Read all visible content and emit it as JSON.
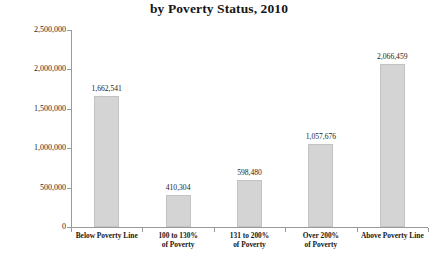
{
  "chart_data": {
    "type": "bar",
    "title": "by Poverty Status, 2010",
    "xlabel": "",
    "ylabel": "Recipients",
    "ylim": [
      0,
      2500000
    ],
    "grid": false,
    "legend": null,
    "ytick_labels": [
      "0",
      "500,000",
      "1,000,000",
      "1,500,000",
      "2,000,000",
      "2,500,000"
    ],
    "ytick_values": [
      0,
      500000,
      1000000,
      1500000,
      2000000,
      2500000
    ],
    "categories": [
      "Below Poverty Line",
      "100 to 130%\nof Poverty",
      "131 to 200%\nof Poverty",
      "Over 200%\nof Poverty",
      "Above Poverty Line"
    ],
    "values": [
      1662541,
      410304,
      598480,
      1057676,
      2066459
    ],
    "value_labels": [
      "1,662,541",
      "410,304",
      "598,480",
      "1,057,676",
      "2,066,459"
    ],
    "bar_color": "#d4d4d4",
    "bar_border_color": "#c3c3c3",
    "axis_color": "#9a9a9a"
  }
}
